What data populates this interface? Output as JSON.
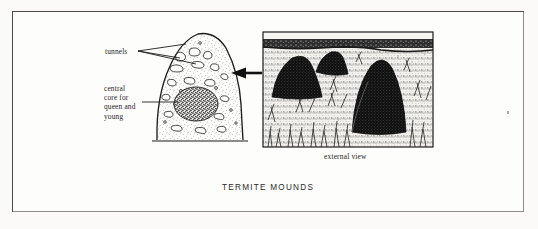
{
  "figure": {
    "title": "TERMITE MOUNDS",
    "caption_external": "external view",
    "labels": {
      "tunnels": "tunnels",
      "central_core": "central\ncore for\nqueen and\nyoung"
    }
  },
  "panels": {
    "cutaway": {
      "name": "cutaway cross-section of termite mound",
      "features": [
        "stippled earth body",
        "tunnel chambers",
        "dark central core"
      ]
    },
    "photo": {
      "name": "external view of termite mounds in grassland",
      "mound_count": 3,
      "features": [
        "dark horizon treeline",
        "grass tufts",
        "three dark mounds"
      ]
    }
  },
  "arrows": {
    "panel_link": "arrow pointing from external view to cutaway"
  },
  "colors": {
    "frame": "#4a4a4a",
    "ink": "#1d1d1d",
    "paper": "#fdfdfb",
    "page": "#fbfaf8",
    "mound_dark": "#141414"
  }
}
